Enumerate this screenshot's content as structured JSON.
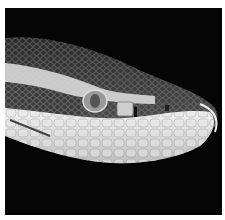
{
  "image": {
    "subject": "snake head close-up",
    "style": "grayscale photograph",
    "background_color": "#050505",
    "frame_color": "#ffffff"
  }
}
